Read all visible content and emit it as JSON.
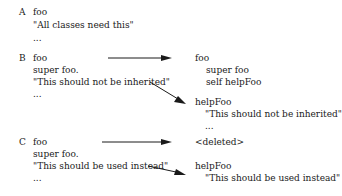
{
  "sections": {
    "A": {
      "label": "A",
      "left": [
        "foo",
        "\"All classes need this\"",
        "..."
      ]
    },
    "B": {
      "label": "B",
      "left": [
        "foo",
        "super foo.",
        "\"This should not be inherited\"",
        "..."
      ],
      "right_foo": [
        "foo",
        "super foo",
        "self helpFoo"
      ],
      "right_help": [
        "helpFoo",
        "\"This should not be inherited\"",
        "..."
      ]
    },
    "C": {
      "label": "C",
      "left": [
        "foo",
        "super foo.",
        "\"This should be used instead\"",
        "..."
      ],
      "right_foo": [
        "<deleted>"
      ],
      "right_help": [
        "helpFoo",
        "\"This should be used instead\""
      ]
    }
  },
  "arrows": [
    {
      "from": "B.foo",
      "to": "B.right_foo"
    },
    {
      "from": "B.comment",
      "to": "B.helpFoo"
    },
    {
      "from": "C.foo",
      "to": "C.deleted"
    },
    {
      "from": "C.comment",
      "to": "C.helpFoo"
    }
  ]
}
